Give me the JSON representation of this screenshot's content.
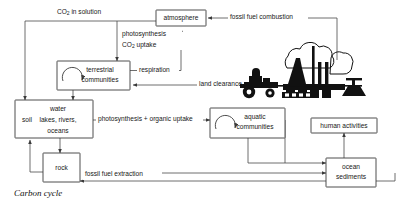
{
  "diagram": {
    "caption": "Carbon cycle",
    "nodes": [
      {
        "id": "atmosphere",
        "label_lines": [
          "atmosphere"
        ]
      },
      {
        "id": "terrestrial",
        "label_lines": [
          "terrestrial",
          "communities"
        ]
      },
      {
        "id": "soil_water",
        "label_lines": [
          "soil",
          "water",
          "lakes, rivers,",
          "oceans"
        ]
      },
      {
        "id": "rock",
        "label_lines": [
          "rock"
        ]
      },
      {
        "id": "aquatic",
        "label_lines": [
          "aquatic",
          "communities"
        ]
      },
      {
        "id": "human",
        "label_lines": [
          "human activities"
        ]
      },
      {
        "id": "ocean_sed",
        "label_lines": [
          "ocean",
          "sediments"
        ]
      }
    ],
    "flows": [
      {
        "id": "co2_solution",
        "label": "CO2 in solution"
      },
      {
        "id": "photosynthesis",
        "label_lines": [
          "photosynthesis",
          "CO2  uptake"
        ]
      },
      {
        "id": "respiration",
        "label": "respiration"
      },
      {
        "id": "combustion",
        "label": "fossil fuel combustion"
      },
      {
        "id": "land_clearance",
        "label": "land clearance"
      },
      {
        "id": "photo_organic",
        "label": "photosynthesis + organic uptake"
      },
      {
        "id": "extraction",
        "label": "fossil fuel extraction"
      }
    ],
    "illustration": "industrial-factory-tractor-silhouette",
    "colors": {
      "line": "#4a4a4a",
      "box_stroke": "#3a3a3a",
      "text": "#171717",
      "background": "#ffffff",
      "illustration": "#111111"
    }
  }
}
